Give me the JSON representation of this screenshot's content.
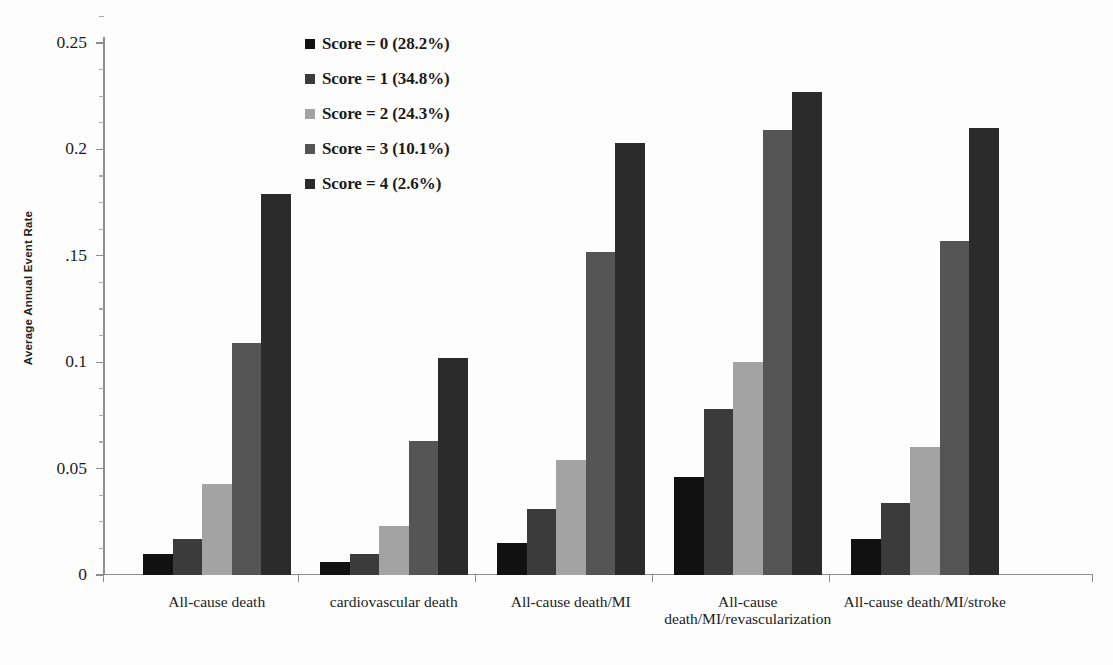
{
  "chart_data": {
    "type": "bar",
    "title": "",
    "xlabel": "",
    "ylabel": "Average Annual Event Rate",
    "ylim": [
      0,
      0.27
    ],
    "grid": false,
    "legend_position": "top-center-left",
    "y_ticks": [
      {
        "value": 0.25,
        "label": "0.25"
      },
      {
        "value": 0.2,
        "label": "0.2"
      },
      {
        "value": 0.15,
        "label": ".15"
      },
      {
        "value": 0.1,
        "label": "0.1"
      },
      {
        "value": 0.05,
        "label": "0.05"
      },
      {
        "value": 0,
        "label": "0"
      }
    ],
    "y_minor_ticks": [
      0.2625,
      0.2375,
      0.225,
      0.2125,
      0.1875,
      0.175,
      0.1625,
      0.1375,
      0.125,
      0.1125,
      0.0875,
      0.075,
      0.0625,
      0.0375,
      0.025,
      0.0125
    ],
    "categories": [
      "All-cause death",
      "cardiovascular death",
      "All-cause death/MI",
      "All-cause death/MI/revascularization",
      "All-cause death/MI/stroke"
    ],
    "category_lines": [
      [
        "All-cause death"
      ],
      [
        "cardiovascular death"
      ],
      [
        "All-cause death/MI"
      ],
      [
        "All-cause",
        "death/MI/revascularization"
      ],
      [
        "All-cause death/MI/stroke"
      ]
    ],
    "series": [
      {
        "name": "Score = 0 (28.2%)",
        "color": "#111111",
        "values": [
          0.01,
          0.006,
          0.015,
          0.046,
          0.017
        ]
      },
      {
        "name": "Score = 1 (34.8%)",
        "color": "#3b3b3b",
        "values": [
          0.017,
          0.01,
          0.031,
          0.078,
          0.034
        ]
      },
      {
        "name": "Score = 2 (24.3%)",
        "color": "#a3a3a3",
        "values": [
          0.043,
          0.023,
          0.054,
          0.1,
          0.06
        ]
      },
      {
        "name": "Score = 3 (10.1%)",
        "color": "#555555",
        "values": [
          0.109,
          0.063,
          0.152,
          0.209,
          0.157
        ]
      },
      {
        "name": "Score = 4 (2.6%)",
        "color": "#2b2b2b",
        "values": [
          0.179,
          0.102,
          0.203,
          0.227,
          0.21
        ]
      }
    ]
  },
  "legend": {
    "items": [
      {
        "label": "Score = 0 (28.2%)",
        "color": "#111111"
      },
      {
        "label": "Score = 1 (34.8%)",
        "color": "#3b3b3b"
      },
      {
        "label": "Score = 2 (24.3%)",
        "color": "#a3a3a3"
      },
      {
        "label": "Score = 3 (10.1%)",
        "color": "#555555"
      },
      {
        "label": "Score = 4 (2.6%)",
        "color": "#2b2b2b"
      }
    ]
  },
  "axis": {
    "y_title": "Average Annual Event Rate"
  }
}
